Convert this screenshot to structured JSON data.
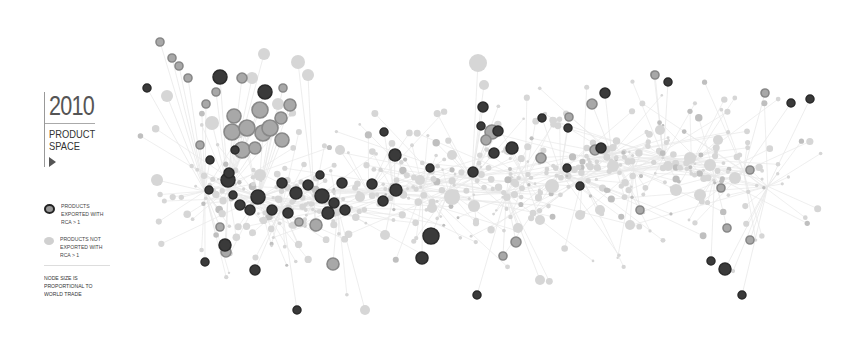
{
  "header": {
    "year": "2010",
    "title_line1": "PRODUCT",
    "title_line2": "SPACE"
  },
  "legend": {
    "exported": {
      "label": "PRODUCTS EXPORTED WITH RCA > 1",
      "color": "#222222"
    },
    "not_exported": {
      "label": "PRODUCTS NOT EXPORTED WITH RCA > 1",
      "color": "#cccccc"
    },
    "note": "NODE SIZE IS PROPORTIONAL TO WORLD TRADE"
  },
  "colors": {
    "edge": "#e8e8e8",
    "node_light": "#d6d6d6",
    "node_mid": "#a8a8a8",
    "node_dark": "#2a2a2a",
    "node_ring": "#888888"
  },
  "network": {
    "description": "Product space network diagram: nodes are products, dark nodes are products exported with RCA > 1",
    "dense_core": {
      "x": [
        180,
        760
      ],
      "y": [
        150,
        230
      ]
    },
    "dark_nodes": [
      [
        220,
        77,
        7
      ],
      [
        265,
        92,
        7
      ],
      [
        147,
        88,
        4
      ],
      [
        228,
        180,
        7
      ],
      [
        258,
        197,
        7
      ],
      [
        282,
        183,
        5
      ],
      [
        296,
        193,
        6
      ],
      [
        308,
        185,
        5
      ],
      [
        322,
        196,
        7
      ],
      [
        334,
        203,
        5
      ],
      [
        328,
        213,
        6
      ],
      [
        345,
        210,
        5
      ],
      [
        250,
        210,
        5
      ],
      [
        240,
        205,
        5
      ],
      [
        233,
        195,
        4
      ],
      [
        209,
        190,
        4
      ],
      [
        210,
        160,
        4
      ],
      [
        229,
        173,
        5
      ],
      [
        205,
        262,
        4
      ],
      [
        225,
        245,
        6
      ],
      [
        255,
        270,
        5
      ],
      [
        320,
        175,
        4
      ],
      [
        235,
        150,
        4
      ],
      [
        272,
        210,
        5
      ],
      [
        288,
        213,
        5
      ],
      [
        342,
        183,
        5
      ],
      [
        395,
        155,
        6
      ],
      [
        396,
        190,
        6
      ],
      [
        383,
        201,
        5
      ],
      [
        431,
        236,
        8
      ],
      [
        430,
        168,
        4
      ],
      [
        473,
        172,
        5
      ],
      [
        422,
        258,
        6
      ],
      [
        483,
        107,
        5
      ],
      [
        481,
        126,
        4
      ],
      [
        512,
        148,
        6
      ],
      [
        494,
        153,
        5
      ],
      [
        498,
        131,
        5
      ],
      [
        601,
        148,
        5
      ],
      [
        567,
        168,
        4
      ],
      [
        568,
        128,
        4
      ],
      [
        605,
        93,
        5
      ],
      [
        668,
        82,
        4
      ],
      [
        477,
        295,
        4
      ],
      [
        742,
        295,
        4
      ],
      [
        711,
        261,
        4
      ],
      [
        725,
        269,
        6
      ],
      [
        791,
        103,
        4
      ],
      [
        810,
        99,
        4
      ],
      [
        384,
        132,
        4
      ],
      [
        297,
        310,
        4
      ],
      [
        580,
        186,
        4
      ],
      [
        542,
        118,
        4
      ],
      [
        372,
        184,
        5
      ]
    ],
    "ring_nodes": [
      [
        160,
        42,
        4
      ],
      [
        172,
        58,
        4
      ],
      [
        179,
        66,
        4
      ],
      [
        188,
        78,
        4
      ],
      [
        242,
        78,
        5
      ],
      [
        216,
        92,
        4
      ],
      [
        206,
        104,
        4
      ],
      [
        234,
        116,
        7
      ],
      [
        260,
        110,
        8
      ],
      [
        263,
        133,
        8
      ],
      [
        232,
        132,
        8
      ],
      [
        247,
        128,
        8
      ],
      [
        270,
        128,
        8
      ],
      [
        242,
        150,
        8
      ],
      [
        281,
        118,
        6
      ],
      [
        290,
        105,
        6
      ],
      [
        282,
        140,
        7
      ],
      [
        255,
        148,
        6
      ],
      [
        283,
        88,
        4
      ],
      [
        220,
        227,
        4
      ],
      [
        226,
        252,
        5
      ],
      [
        316,
        225,
        6
      ],
      [
        333,
        264,
        6
      ],
      [
        492,
        132,
        7
      ],
      [
        486,
        140,
        5
      ],
      [
        541,
        158,
        5
      ],
      [
        569,
        117,
        4
      ],
      [
        592,
        104,
        5
      ],
      [
        640,
        210,
        4
      ],
      [
        655,
        75,
        4
      ],
      [
        765,
        93,
        4
      ],
      [
        727,
        228,
        4
      ],
      [
        750,
        240,
        4
      ],
      [
        721,
        188,
        4
      ],
      [
        750,
        170,
        4
      ],
      [
        595,
        150,
        5
      ],
      [
        516,
        242,
        5
      ],
      [
        503,
        256,
        4
      ],
      [
        299,
        222,
        4
      ],
      [
        200,
        145,
        4
      ]
    ],
    "light_large_nodes": [
      [
        478,
        63,
        9
      ],
      [
        167,
        96,
        6
      ],
      [
        157,
        180,
        6
      ],
      [
        298,
        62,
        7
      ],
      [
        264,
        54,
        6
      ],
      [
        252,
        78,
        6
      ],
      [
        308,
        75,
        6
      ],
      [
        278,
        104,
        6
      ],
      [
        212,
        123,
        7
      ],
      [
        260,
        175,
        6
      ],
      [
        452,
        197,
        8
      ],
      [
        474,
        206,
        6
      ],
      [
        552,
        186,
        7
      ],
      [
        690,
        158,
        6
      ],
      [
        710,
        165,
        6
      ],
      [
        735,
        178,
        6
      ],
      [
        700,
        195,
        6
      ],
      [
        676,
        190,
        6
      ],
      [
        432,
        208,
        5
      ],
      [
        360,
        197,
        5
      ],
      [
        420,
        180,
        5
      ],
      [
        613,
        166,
        6
      ],
      [
        668,
        166,
        5
      ],
      [
        600,
        210,
        5
      ],
      [
        540,
        220,
        5
      ],
      [
        630,
        225,
        5
      ],
      [
        508,
        150,
        5
      ],
      [
        518,
        228,
        5
      ],
      [
        365,
        310,
        5
      ],
      [
        718,
        140,
        5
      ],
      [
        580,
        215,
        5
      ],
      [
        484,
        85,
        5
      ],
      [
        452,
        155,
        5
      ],
      [
        385,
        235,
        5
      ],
      [
        540,
        280,
        5
      ],
      [
        340,
        150,
        5
      ],
      [
        660,
        130,
        5
      ]
    ]
  }
}
